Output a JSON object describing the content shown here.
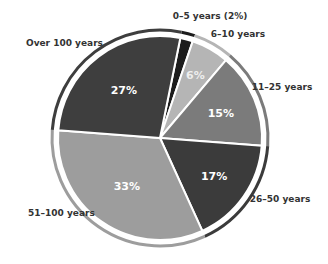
{
  "chart_data": {
    "type": "pie",
    "title": "",
    "unit": "%",
    "start_angle_deg": 11.5,
    "direction": "clockwise",
    "slices": [
      {
        "label": "0–5 years (2%)",
        "category": "0–5 years",
        "value": 2,
        "pct_label": "",
        "color": "#1c1c1c",
        "text_color": "#ffffff"
      },
      {
        "label": "6–10 years",
        "category": "6–10 years",
        "value": 6,
        "pct_label": "6%",
        "color": "#b5b5b5",
        "text_color": "#eeeeee"
      },
      {
        "label": "11–25 years",
        "category": "11–25 years",
        "value": 15,
        "pct_label": "15%",
        "color": "#7b7b7b",
        "text_color": "#ffffff"
      },
      {
        "label": "26–50 years",
        "category": "26–50 years",
        "value": 17,
        "pct_label": "17%",
        "color": "#3b3b3b",
        "text_color": "#ffffff"
      },
      {
        "label": "51–100 years",
        "category": "51–100 years",
        "value": 33,
        "pct_label": "33%",
        "color": "#9d9d9d",
        "text_color": "#ffffff"
      },
      {
        "label": "Over 100 years",
        "category": "Over 100 years",
        "value": 27,
        "pct_label": "27%",
        "color": "#3e3e3e",
        "text_color": "#ffffff"
      }
    ]
  }
}
